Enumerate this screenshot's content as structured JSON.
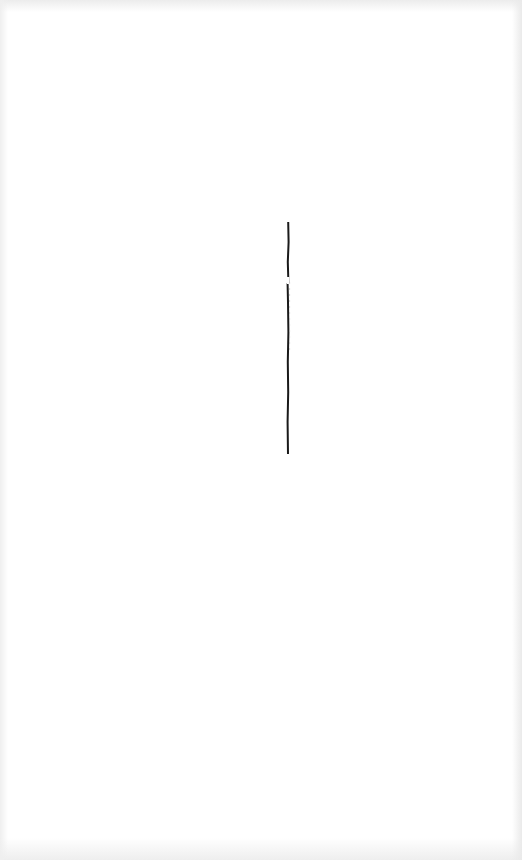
{
  "document": {
    "type": "scanned-page",
    "text": "",
    "marks": [
      {
        "kind": "vertical-ink-stroke",
        "color": "#1a1a1a",
        "x": 288,
        "y_start": 222,
        "y_end": 454
      }
    ],
    "background_color": "#ffffff",
    "show_through": true
  }
}
